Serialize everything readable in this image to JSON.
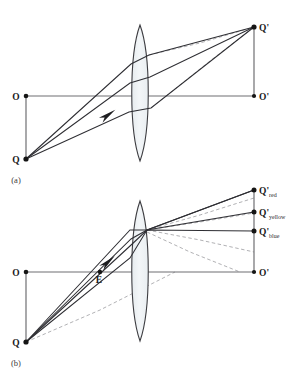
{
  "figure": {
    "kind": "optics-ray-diagram",
    "panels": [
      {
        "id": "a",
        "caption": "(a)",
        "caption_x": 16,
        "caption_y": 183,
        "description": "Single lens forming one image point Q-prime from object point Q",
        "axis": {
          "y": 96,
          "x_start": 26,
          "x_end": 256
        },
        "lens": {
          "cx": 140,
          "cy": 93,
          "top_y": 25,
          "bottom_y": 161,
          "half_width": 11
        },
        "points": [
          {
            "name": "O",
            "label": "O",
            "x": 26,
            "y": 96,
            "dot": true,
            "label_dx": -10,
            "label_dy": 3.5
          },
          {
            "name": "Q",
            "label": "Q",
            "x": 26,
            "y": 159,
            "dot": true,
            "label_dx": -10,
            "label_dy": 3.5
          },
          {
            "name": "O'",
            "label": "O'",
            "x": 254,
            "y": 96,
            "dot": true,
            "label_dx": 5,
            "label_dy": 3.5
          },
          {
            "name": "Q'",
            "label": "Q'",
            "x": 254,
            "y": 27,
            "dot": true,
            "label_dx": 5,
            "label_dy": 3.5
          }
        ],
        "object_stem": {
          "x": 26,
          "y_top": 96,
          "y_bottom": 159
        },
        "image_stem": {
          "x": 254,
          "y_top": 27,
          "y_bottom": 96
        },
        "rays": [
          {
            "name": "upper-marginal-ray",
            "pts": "26,159 131,64 149,55 254,27"
          },
          {
            "name": "central-ray",
            "pts": "26,159 130,83 150,77 254,27",
            "arrow": true,
            "arrow_x": 108,
            "arrow_y": 115,
            "arrow_angle": -36
          },
          {
            "name": "lower-marginal-ray",
            "pts": "26,159 129,112 151,108 254,27"
          }
        ],
        "dashed_rays": [
          {
            "name": "virtual-extension-upper",
            "pts": "149,55 200,43 254,27"
          },
          {
            "name": "virtual-extension-lower",
            "pts": "151,108 210,61 254,27"
          }
        ]
      },
      {
        "id": "b",
        "caption": "(b)",
        "caption_x": 16,
        "caption_y": 366,
        "description": "Chromatic dispersion: three colored image points red, yellow, blue",
        "axis": {
          "y": 272,
          "x_start": 26,
          "x_end": 256
        },
        "lens": {
          "cx": 140,
          "cy": 270,
          "top_y": 201,
          "bottom_y": 341,
          "half_width": 11
        },
        "points": [
          {
            "name": "O",
            "label": "O",
            "x": 26,
            "y": 272,
            "dot": true,
            "label_dx": -10,
            "label_dy": 3.5
          },
          {
            "name": "Q",
            "label": "Q",
            "x": 26,
            "y": 342,
            "dot": true,
            "label_dx": -10,
            "label_dy": 3.5
          },
          {
            "name": "E",
            "label": "E",
            "x": 100,
            "y": 272,
            "dot": true,
            "label_dx": -3,
            "label_dy": 11
          },
          {
            "name": "O'",
            "label": "O'",
            "x": 254,
            "y": 272,
            "dot": true,
            "label_dx": 5,
            "label_dy": 3.5
          }
        ],
        "object_stem": {
          "x": 26,
          "y_top": 272,
          "y_bottom": 342
        },
        "image_stem": {
          "x": 254,
          "y_top": 190,
          "y_bottom": 272
        },
        "image_points": [
          {
            "name": "Q'red",
            "label": "Q'",
            "sub": "red",
            "x": 254,
            "y": 190
          },
          {
            "name": "Q'yellow",
            "label": "Q'",
            "sub": "yellow",
            "x": 254,
            "y": 212
          },
          {
            "name": "Q'blue",
            "label": "Q'",
            "sub": "blue",
            "x": 254,
            "y": 231
          }
        ],
        "rays": [
          {
            "name": "ray-to-red",
            "pts": "26,342 131,239 147,230 254,190"
          },
          {
            "name": "ray-to-yellow",
            "pts": "26,342 130,246 147,230 254,212",
            "arrow": true,
            "arrow_x": 108,
            "arrow_y": 262,
            "arrow_angle": -42
          },
          {
            "name": "ray-to-blue",
            "pts": "26,342 130,258 147,230 254,231"
          },
          {
            "name": "ray-upper-aux",
            "pts": "26,342 130,230 147,230 254,190"
          }
        ],
        "dashed_rays": [
          {
            "name": "virtual-extension-red",
            "pts": "147,230 200,215 254,198"
          },
          {
            "name": "virtual-extension-yellow",
            "pts": "147,230 200,222 254,213"
          },
          {
            "name": "virtual-extension-blue",
            "pts": "147,230 200,240 254,252"
          },
          {
            "name": "virtual-extension-low",
            "pts": "26,342 100,310 175,272"
          },
          {
            "name": "virtual-extension-low2",
            "pts": "147,232 190,252 240,272"
          }
        ]
      }
    ],
    "colors": {
      "ray_stroke": "#2e2e33",
      "axis_stroke": "#6f6f72",
      "dashed_stroke": "#a8a8ac",
      "lens_fill": "#eef1f3",
      "lens_stroke": "#3c3c40",
      "dot_fill": "#151515",
      "label_fill": "#1a1a1a",
      "background": "#ffffff"
    }
  }
}
